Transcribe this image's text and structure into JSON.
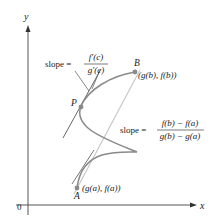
{
  "figure": {
    "type": "cauchy-mean-value-theorem-diagram",
    "axes": {
      "x_label": "x",
      "y_label": "y",
      "origin_label": "0"
    },
    "points": {
      "P": {
        "label": "P"
      },
      "A": {
        "label": "A",
        "coords": "(g(a), f(a))"
      },
      "B": {
        "label": "B",
        "coords": "(g(b), f(b))"
      }
    },
    "tangent_slope": {
      "prefix": "slope =",
      "numerator": "f′(c)",
      "denominator": "g′(c)"
    },
    "secant_slope": {
      "prefix": "slope =",
      "numerator": "f(b) − f(a)",
      "denominator": "g(b) − g(a)"
    },
    "colors": {
      "axes": "#555555",
      "curve": "#8a8a8a",
      "tangent": "#555555",
      "secant": "#c8c8c8",
      "points": "#8a8a8a",
      "text": "#222222"
    }
  }
}
